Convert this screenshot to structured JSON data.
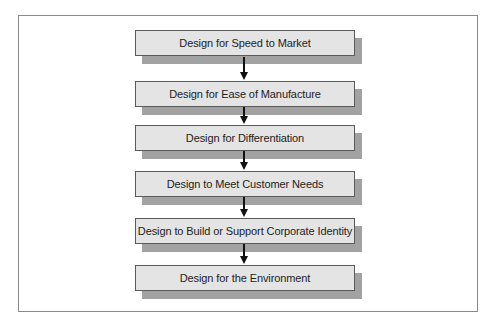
{
  "diagram": {
    "type": "flowchart",
    "direction": "top-to-bottom",
    "steps": [
      {
        "label": "Design for Speed to Market"
      },
      {
        "label": "Design for Ease of Manufacture"
      },
      {
        "label": "Design for Differentiation"
      },
      {
        "label": "Design to Meet Customer Needs"
      },
      {
        "label": "Design to Build or Support Corporate Identity"
      },
      {
        "label": "Design for the Environment"
      }
    ],
    "colors": {
      "box_fill": "#e4e4e4",
      "box_border": "#5a5a5a",
      "shadow": "#a2a2a2",
      "arrow": "#111111",
      "frame_border": "#8a8a8a"
    }
  }
}
